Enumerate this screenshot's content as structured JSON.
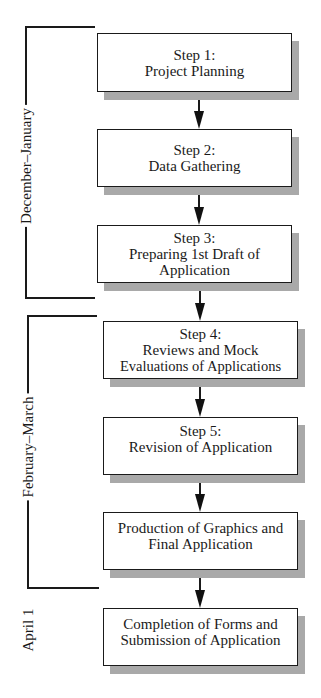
{
  "diagram": {
    "type": "flowchart",
    "direction": "top-to-bottom",
    "colors": {
      "stroke": "#1a1a1a",
      "shadow": "#a9a9a9",
      "box_fill": "#ffffff"
    },
    "steps": [
      {
        "lines": [
          "Step 1:",
          "Project Planning"
        ]
      },
      {
        "lines": [
          "Step 2:",
          "Data Gathering"
        ]
      },
      {
        "lines": [
          "Step 3:",
          "Preparing 1st Draft of",
          "Application"
        ]
      },
      {
        "lines": [
          "Step 4:",
          "Reviews and Mock",
          "Evaluations of Applications"
        ]
      },
      {
        "lines": [
          "Step 5:",
          "Revision of Application"
        ]
      },
      {
        "lines": [
          "Production of Graphics and",
          "Final Application"
        ]
      },
      {
        "lines": [
          "Completion of Forms and",
          "Submission of Application"
        ]
      }
    ],
    "phases": [
      {
        "label": "December–January",
        "covers_steps": [
          1,
          2,
          3
        ]
      },
      {
        "label": "February–March",
        "covers_steps": [
          4,
          5,
          6
        ]
      },
      {
        "label": "April 1",
        "covers_steps": [
          7
        ]
      }
    ]
  }
}
